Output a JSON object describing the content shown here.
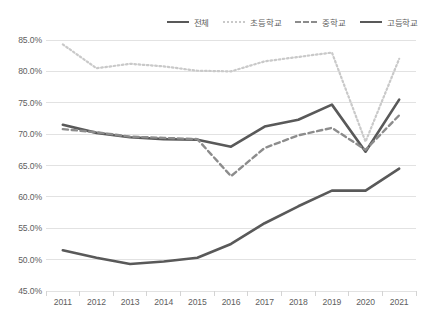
{
  "chart_data": {
    "type": "line",
    "title": "",
    "subtitle": "",
    "xlabel": "",
    "ylabel": "",
    "categories": [
      "2011",
      "2012",
      "2013",
      "2014",
      "2015",
      "2016",
      "2017",
      "2018",
      "2019",
      "2020",
      "2021"
    ],
    "ylim": [
      45.0,
      85.0
    ],
    "ytick_labels": [
      "85.0%",
      "80.0%",
      "75.0%",
      "70.0%",
      "65.0%",
      "60.0%",
      "55.0%",
      "50.0%",
      "45.0%"
    ],
    "ytick_values": [
      85.0,
      80.0,
      75.0,
      70.0,
      65.0,
      60.0,
      55.0,
      50.0,
      45.0
    ],
    "grid": true,
    "legend_position": "top-right",
    "series": [
      {
        "name": "전체",
        "style": "solid",
        "color": "#595959",
        "width": 2.6,
        "values": [
          71.5,
          70.2,
          69.5,
          69.2,
          69.1,
          68.0,
          71.2,
          72.3,
          74.7,
          67.2,
          75.5
        ]
      },
      {
        "name": "초등학교",
        "style": "dotted",
        "color": "#c9c9c9",
        "width": 2.2,
        "values": [
          84.3,
          80.5,
          81.2,
          80.8,
          80.1,
          80.0,
          81.6,
          82.3,
          83.0,
          68.8,
          82.0
        ]
      },
      {
        "name": "중학교",
        "style": "dashed",
        "color": "#8c8c8c",
        "width": 2.4,
        "values": [
          70.8,
          70.3,
          69.6,
          69.4,
          69.2,
          63.3,
          67.8,
          69.8,
          71.0,
          67.5,
          73.0
        ]
      },
      {
        "name": "고등학교",
        "style": "solid",
        "color": "#595959",
        "width": 2.6,
        "values": [
          51.5,
          50.3,
          49.3,
          49.7,
          50.3,
          52.5,
          55.8,
          58.5,
          61.0,
          61.0,
          64.5
        ]
      }
    ]
  },
  "colors": {
    "background": "#ffffff",
    "gridline": "#e2e2e2",
    "axis": "#d4d4d4",
    "text": "#5e5e5e"
  }
}
